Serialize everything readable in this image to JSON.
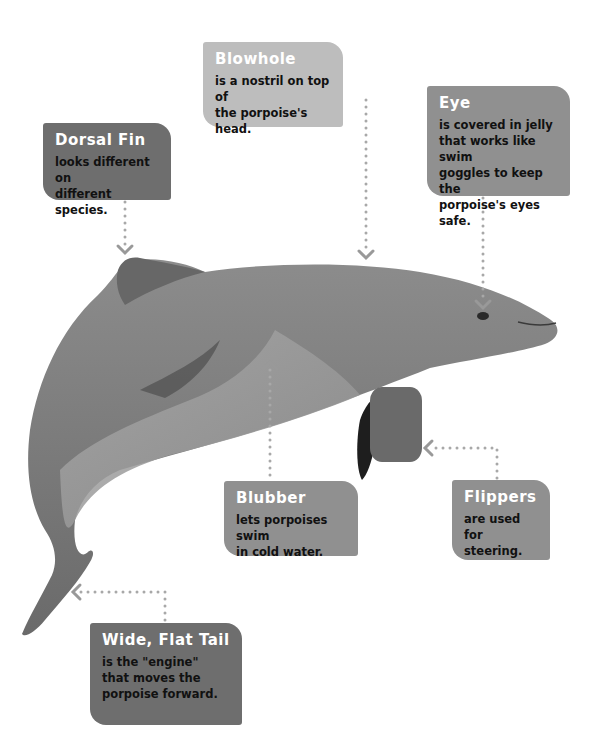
{
  "diagram": {
    "subject": "porpoise",
    "labels": [
      {
        "id": "dorsal-fin",
        "title": "Dorsal Fin",
        "lines": [
          "looks different on",
          "different species."
        ]
      },
      {
        "id": "blowhole",
        "title": "Blowhole",
        "lines": [
          "is a nostril on top of",
          "the porpoise's head."
        ]
      },
      {
        "id": "eye",
        "title": "Eye",
        "lines": [
          "is covered in jelly",
          "that works like swim",
          "goggles to keep the",
          "porpoise's eyes safe."
        ]
      },
      {
        "id": "blubber",
        "title": "Blubber",
        "lines": [
          "lets porpoises swim",
          "in cold water."
        ]
      },
      {
        "id": "flippers",
        "title": "Flippers",
        "lines": [
          "are used",
          "for steering."
        ]
      },
      {
        "id": "tail",
        "title": "Wide, Flat Tail",
        "lines": [
          "is the \"engine\"",
          "that moves the",
          "porpoise forward."
        ]
      }
    ],
    "colors": {
      "box_dark": "#6e6e6e",
      "box_mid": "#909090",
      "box_light": "#bdbdbd",
      "connector": "#a0a0a0",
      "body": "#7a7a7a"
    }
  }
}
